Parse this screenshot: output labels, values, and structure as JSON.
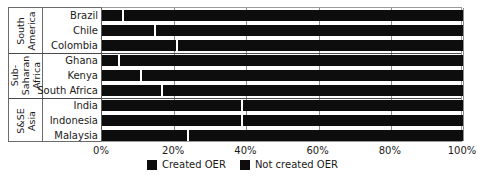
{
  "chart_data": {
    "type": "bar",
    "orientation": "horizontal",
    "stacked": true,
    "normalized_percent": true,
    "title": "",
    "subtitle": "",
    "xlabel": "",
    "ylabel": "",
    "xlim": [
      0,
      100
    ],
    "xticks": [
      0,
      20,
      40,
      60,
      80,
      100
    ],
    "xtick_labels": [
      "0%",
      "20%",
      "40%",
      "60%",
      "80%",
      "100%"
    ],
    "grid": "vertical",
    "legend_position": "bottom-center",
    "legend": [
      "Created OER",
      "Not created OER"
    ],
    "categories": [
      "Brazil",
      "Chile",
      "Colombia",
      "Ghana",
      "Kenya",
      "South Africa",
      "India",
      "Indonesia",
      "Malaysia"
    ],
    "groups": [
      {
        "label": "South America",
        "categories": [
          "Brazil",
          "Chile",
          "Colombia"
        ]
      },
      {
        "label": "Sub-Saharan Africa",
        "categories": [
          "Ghana",
          "Kenya",
          "South Africa"
        ]
      },
      {
        "label": "S&SE Asia",
        "categories": [
          "India",
          "Indonesia",
          "Malaysia"
        ]
      }
    ],
    "series": [
      {
        "name": "Created OER",
        "color": "#0d0d0d",
        "values": [
          6,
          15,
          21,
          5,
          11,
          17,
          39,
          39,
          24
        ]
      },
      {
        "name": "Not created OER",
        "color": "#0d0d0d",
        "values": [
          94,
          85,
          79,
          95,
          89,
          83,
          61,
          61,
          76
        ]
      }
    ]
  },
  "axis": {
    "ticks": [
      {
        "value": 0,
        "label": "0%"
      },
      {
        "value": 20,
        "label": "20%"
      },
      {
        "value": 40,
        "label": "40%"
      },
      {
        "value": 60,
        "label": "60%"
      },
      {
        "value": 80,
        "label": "80%"
      },
      {
        "value": 100,
        "label": "100%"
      }
    ]
  },
  "groups": [
    {
      "label": "South America",
      "rows": [
        {
          "label": "Brazil",
          "created": 6,
          "not_created": 94
        },
        {
          "label": "Chile",
          "created": 15,
          "not_created": 85
        },
        {
          "label": "Colombia",
          "created": 21,
          "not_created": 79
        }
      ]
    },
    {
      "label": "Sub-Saharan Africa",
      "rows": [
        {
          "label": "Ghana",
          "created": 5,
          "not_created": 95
        },
        {
          "label": "Kenya",
          "created": 11,
          "not_created": 89
        },
        {
          "label": "South Africa",
          "created": 17,
          "not_created": 83
        }
      ]
    },
    {
      "label": "S&SE Asia",
      "rows": [
        {
          "label": "India",
          "created": 39,
          "not_created": 61
        },
        {
          "label": "Indonesia",
          "created": 39,
          "not_created": 61
        },
        {
          "label": "Malaysia",
          "created": 24,
          "not_created": 76
        }
      ]
    }
  ],
  "legend": {
    "items": [
      {
        "label": "Created OER",
        "color": "#0d0d0d"
      },
      {
        "label": "Not created OER",
        "color": "#0d0d0d"
      }
    ]
  }
}
